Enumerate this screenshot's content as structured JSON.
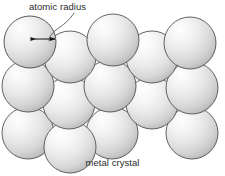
{
  "figure": {
    "background_color": "#ffffff",
    "width": 225,
    "height": 176
  },
  "annotations": {
    "atomic_radius_label": "atomic radius",
    "caption": "metal crystal"
  },
  "style": {
    "sphere_fill_light": "#fdfdfd",
    "sphere_fill_mid": "#e2e2e2",
    "sphere_fill_dark": "#b9b9b9",
    "sphere_stroke": "#4a4a4a",
    "text_color": "#2b2b2b",
    "arrow_color": "#1a1a1a",
    "leader_color": "#555555"
  },
  "diagram_data": {
    "type": "packing-diagram",
    "description": "Close-packed arrangement of identical spheres representing metal atoms; a double-headed arrow marks the atomic radius from the centre to the edge of one sphere.",
    "sphere_radius_px": 26,
    "sphere_count": 14,
    "spheres": [
      {
        "id": "s1",
        "cx": 30,
        "cy": 42,
        "r": 26,
        "row": 1
      },
      {
        "id": "s2",
        "cx": 113,
        "cy": 40,
        "r": 26,
        "row": 1
      },
      {
        "id": "s3",
        "cx": 190,
        "cy": 43,
        "r": 26,
        "row": 1
      },
      {
        "id": "s4",
        "cx": 70,
        "cy": 57,
        "r": 26,
        "row": 1
      },
      {
        "id": "s5",
        "cx": 152,
        "cy": 57,
        "r": 26,
        "row": 1
      },
      {
        "id": "s6",
        "cx": 28,
        "cy": 86,
        "r": 26,
        "row": 2
      },
      {
        "id": "s7",
        "cx": 110,
        "cy": 86,
        "r": 26,
        "row": 2
      },
      {
        "id": "s8",
        "cx": 192,
        "cy": 88,
        "r": 26,
        "row": 2
      },
      {
        "id": "s9",
        "cx": 69,
        "cy": 103,
        "r": 26,
        "row": 2
      },
      {
        "id": "s10",
        "cx": 152,
        "cy": 103,
        "r": 26,
        "row": 2
      },
      {
        "id": "s11",
        "cx": 28,
        "cy": 133,
        "r": 26,
        "row": 3
      },
      {
        "id": "s12",
        "cx": 70,
        "cy": 147,
        "r": 26,
        "row": 3
      },
      {
        "id": "s13",
        "cx": 112,
        "cy": 133,
        "r": 26,
        "row": 3
      },
      {
        "id": "s14",
        "cx": 192,
        "cy": 133,
        "r": 26,
        "row": 3
      }
    ],
    "radius_arrow": {
      "x1": 30,
      "y1": 39,
      "x2": 56,
      "y2": 39,
      "double_headed": true,
      "measures": "atomic radius"
    },
    "leader_line": {
      "from_x": 73,
      "from_y": 14,
      "to_x": 49,
      "to_y": 40,
      "curved": true
    }
  }
}
